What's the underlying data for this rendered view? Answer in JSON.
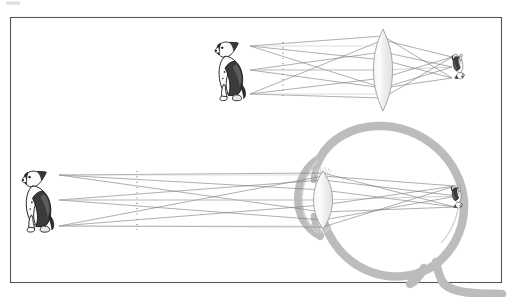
{
  "figure": {
    "title": "Image formation by a converging lens and by the human eye",
    "background_color": "#ffffff",
    "frame": {
      "label": "figure-border",
      "x": 10.5,
      "y": 17.5,
      "width": 491,
      "height": 265,
      "stroke_color": "#555555",
      "stroke_width": 1.1
    },
    "corner_artifact": {
      "label": "scan-artifact",
      "x": 6,
      "y": 1,
      "width": 14,
      "height": 4,
      "color": "#d8d8d8"
    }
  },
  "palette": {
    "ray_line": "#6b6b6b",
    "ray_line_light": "#a8a8a8",
    "axis_line": "#b5b5b5",
    "lens_outline": "#9a9a9a",
    "lens_fill_light": "#fbfbfb",
    "lens_fill_mid": "#ececec",
    "eye_outline": "#b9b9b9",
    "eye_outline_dark": "#ababab",
    "dotted_marker": "#8f8f8f",
    "dog_dark": "#1a1a1a",
    "dog_mid": "#555555",
    "dog_light": "#cfcfcf",
    "frame": "#555555"
  },
  "panels": [
    {
      "id": "lens-panel",
      "name": "converging-lens-diagram",
      "description": "Object (dog) imaged by a thin biconvex converging lens forming a small inverted real image",
      "object": {
        "name": "object-dog-top",
        "label": "dog",
        "x": 214,
        "y": 39,
        "width": 38,
        "height": 62,
        "orientation": "upright",
        "facing": "left"
      },
      "source_points": [
        {
          "name": "object-point-head",
          "x": 250,
          "y": 46
        },
        {
          "name": "object-point-middle",
          "x": 250,
          "y": 70
        },
        {
          "name": "object-point-feet",
          "x": 250,
          "y": 94
        }
      ],
      "optical_axis": {
        "name": "optical-axis",
        "y": 70,
        "x1": 250,
        "x2": 470
      },
      "marker_line": {
        "name": "dotted-reference-line",
        "x": 283,
        "y1": 44,
        "y2": 96,
        "style": "dotted"
      },
      "lens": {
        "name": "converging-lens",
        "type": "biconvex",
        "center_x": 383,
        "center_y": 70,
        "half_height": 41,
        "half_width": 8.5
      },
      "image": {
        "name": "image-dog-top",
        "label": "inverted image of dog",
        "x": 449,
        "y": 54,
        "width": 16,
        "height": 26,
        "orientation": "inverted",
        "type": "real"
      },
      "image_points": [
        {
          "name": "image-point-head",
          "x": 452,
          "y": 78
        },
        {
          "name": "image-point-middle",
          "x": 452,
          "y": 67
        },
        {
          "name": "image-point-feet",
          "x": 452,
          "y": 57
        }
      ]
    },
    {
      "id": "eye-panel",
      "name": "human-eye-diagram",
      "description": "Object (dog) imaged by the eye's cornea and crystalline lens forming a small inverted image on the retina",
      "object": {
        "name": "object-dog-bottom",
        "label": "dog",
        "x": 21,
        "y": 168,
        "width": 40,
        "height": 64,
        "orientation": "upright",
        "facing": "left"
      },
      "source_points": [
        {
          "name": "object-point-head",
          "x": 59,
          "y": 175
        },
        {
          "name": "object-point-middle",
          "x": 59,
          "y": 200
        },
        {
          "name": "object-point-feet",
          "x": 59,
          "y": 226
        }
      ],
      "optical_axis": {
        "name": "optical-axis",
        "y": 200,
        "x1": 59,
        "x2": 470
      },
      "marker_line": {
        "name": "dotted-reference-line",
        "x": 137,
        "y1": 173,
        "y2": 228,
        "style": "dotted"
      },
      "eye": {
        "name": "eyeball",
        "center_x": 395,
        "center_y": 203,
        "radius": 80,
        "wall_thickness": 8,
        "parts": [
          {
            "name": "sclera",
            "label": "sclera"
          },
          {
            "name": "cornea",
            "label": "cornea"
          },
          {
            "name": "crystalline-lens",
            "label": "lens"
          },
          {
            "name": "zonule-fibers",
            "label": "suspensory ligaments"
          },
          {
            "name": "optic-nerve",
            "label": "optic nerve"
          },
          {
            "name": "retina",
            "label": "retina"
          }
        ]
      },
      "lens": {
        "name": "crystalline-lens",
        "type": "biconvex",
        "center_x": 323,
        "center_y": 200,
        "half_height": 29,
        "half_width": 9
      },
      "image": {
        "name": "image-dog-retina",
        "label": "inverted image of dog on retina",
        "x": 448,
        "y": 184,
        "width": 14,
        "height": 24,
        "orientation": "inverted",
        "type": "real"
      },
      "image_points": [
        {
          "name": "image-point-head",
          "x": 455,
          "y": 207
        },
        {
          "name": "image-point-middle",
          "x": 457,
          "y": 196
        },
        {
          "name": "image-point-feet",
          "x": 455,
          "y": 186
        }
      ]
    }
  ]
}
